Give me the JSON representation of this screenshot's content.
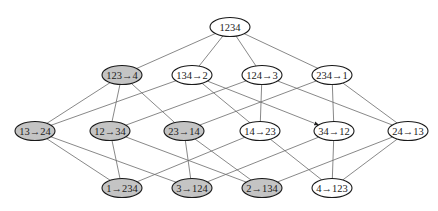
{
  "diagram": {
    "title": "",
    "colors": {
      "shaded_fill": "#c4c4c4",
      "plain_fill": "#ffffff",
      "stroke": "#1a1a1a",
      "edge": "#6a6a6a"
    },
    "node_size": {
      "rx": 20,
      "ry": 9.5
    },
    "nodes": [
      {
        "id": "1234",
        "label": "1234",
        "x": 230,
        "y": 27,
        "shaded": false
      },
      {
        "id": "123-4",
        "label": "123→4",
        "x": 122,
        "y": 75,
        "shaded": true
      },
      {
        "id": "134-2",
        "label": "134→2",
        "x": 192,
        "y": 75,
        "shaded": false
      },
      {
        "id": "124-3",
        "label": "124→3",
        "x": 262,
        "y": 75,
        "shaded": false
      },
      {
        "id": "234-1",
        "label": "234→1",
        "x": 332,
        "y": 75,
        "shaded": false
      },
      {
        "id": "13-24",
        "label": "13→24",
        "x": 35,
        "y": 131,
        "shaded": true
      },
      {
        "id": "12-34",
        "label": "12→34",
        "x": 110,
        "y": 131,
        "shaded": true
      },
      {
        "id": "23-14",
        "label": "23→14",
        "x": 184,
        "y": 131,
        "shaded": true
      },
      {
        "id": "14-23",
        "label": "14→23",
        "x": 260,
        "y": 131,
        "shaded": false
      },
      {
        "id": "34-12",
        "label": "34→12",
        "x": 334,
        "y": 131,
        "shaded": false
      },
      {
        "id": "24-13",
        "label": "24→13",
        "x": 408,
        "y": 131,
        "shaded": false
      },
      {
        "id": "1-234",
        "label": "1→234",
        "x": 122,
        "y": 188,
        "shaded": true
      },
      {
        "id": "3-124",
        "label": "3→124",
        "x": 192,
        "y": 188,
        "shaded": true
      },
      {
        "id": "2-134",
        "label": "2→134",
        "x": 262,
        "y": 188,
        "shaded": true
      },
      {
        "id": "4-123",
        "label": "4→123",
        "x": 332,
        "y": 188,
        "shaded": false
      }
    ],
    "edges": [
      {
        "from": "1234",
        "to": "123-4"
      },
      {
        "from": "1234",
        "to": "134-2"
      },
      {
        "from": "1234",
        "to": "124-3"
      },
      {
        "from": "1234",
        "to": "234-1"
      },
      {
        "from": "123-4",
        "to": "13-24"
      },
      {
        "from": "123-4",
        "to": "12-34"
      },
      {
        "from": "123-4",
        "to": "23-14"
      },
      {
        "from": "134-2",
        "to": "13-24"
      },
      {
        "from": "134-2",
        "to": "14-23"
      },
      {
        "from": "134-2",
        "to": "34-12",
        "arrow": true
      },
      {
        "from": "124-3",
        "to": "12-34"
      },
      {
        "from": "124-3",
        "to": "14-23"
      },
      {
        "from": "124-3",
        "to": "24-13"
      },
      {
        "from": "234-1",
        "to": "23-14"
      },
      {
        "from": "234-1",
        "to": "34-12"
      },
      {
        "from": "234-1",
        "to": "24-13"
      },
      {
        "from": "13-24",
        "to": "1-234"
      },
      {
        "from": "13-24",
        "to": "3-124"
      },
      {
        "from": "12-34",
        "to": "1-234"
      },
      {
        "from": "12-34",
        "to": "2-134"
      },
      {
        "from": "23-14",
        "to": "3-124"
      },
      {
        "from": "23-14",
        "to": "2-134"
      },
      {
        "from": "14-23",
        "to": "1-234"
      },
      {
        "from": "14-23",
        "to": "4-123"
      },
      {
        "from": "34-12",
        "to": "3-124"
      },
      {
        "from": "34-12",
        "to": "4-123"
      },
      {
        "from": "24-13",
        "to": "2-134"
      },
      {
        "from": "24-13",
        "to": "4-123"
      }
    ]
  }
}
